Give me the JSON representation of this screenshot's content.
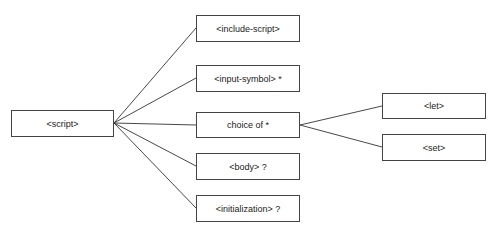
{
  "diagram": {
    "type": "tree",
    "nodes": [
      {
        "id": "script",
        "label": "<script>",
        "x": 11,
        "y": 110,
        "w": 103,
        "h": 27
      },
      {
        "id": "include-script",
        "label": "<include-script>",
        "x": 196,
        "y": 15,
        "w": 104,
        "h": 27
      },
      {
        "id": "input-symbol",
        "label": "<input-symbol> *",
        "x": 196,
        "y": 65,
        "w": 104,
        "h": 27
      },
      {
        "id": "choice-of",
        "label": "choice of *",
        "x": 196,
        "y": 112,
        "w": 104,
        "h": 26
      },
      {
        "id": "body",
        "label": "<body> ?",
        "x": 196,
        "y": 153,
        "w": 104,
        "h": 27
      },
      {
        "id": "initialization",
        "label": "<initialization> ?",
        "x": 196,
        "y": 195,
        "w": 104,
        "h": 27
      },
      {
        "id": "let",
        "label": "<let>",
        "x": 382,
        "y": 93,
        "w": 104,
        "h": 26
      },
      {
        "id": "set",
        "label": "<set>",
        "x": 382,
        "y": 134,
        "w": 104,
        "h": 27
      }
    ],
    "edges": [
      {
        "from": "script",
        "to": "include-script"
      },
      {
        "from": "script",
        "to": "input-symbol"
      },
      {
        "from": "script",
        "to": "choice-of"
      },
      {
        "from": "script",
        "to": "body"
      },
      {
        "from": "script",
        "to": "initialization"
      },
      {
        "from": "choice-of",
        "to": "let"
      },
      {
        "from": "choice-of",
        "to": "set"
      }
    ]
  }
}
